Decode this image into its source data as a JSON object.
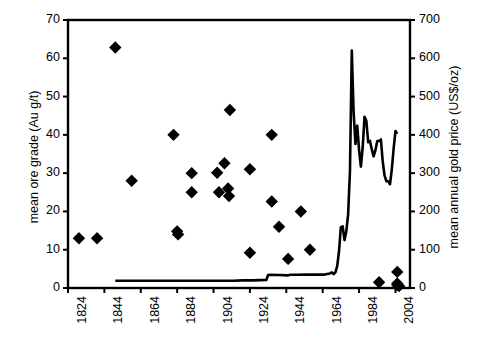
{
  "chart_data": {
    "type": "scatter",
    "title": "",
    "xlabel": "",
    "ylabel": "mean ore grade (Au g/t)",
    "y2label": "mean annual gold price (US$/oz)",
    "xlim": [
      1824,
      2012
    ],
    "ylim": [
      0,
      70
    ],
    "y2lim": [
      0,
      700
    ],
    "grid": false,
    "legend": "none",
    "x_ticks": [
      "1824",
      "1844",
      "1864",
      "1884",
      "1904",
      "1924",
      "1944",
      "1964",
      "1984",
      "2004"
    ],
    "x_tick_values": [
      1824,
      1844,
      1864,
      1884,
      1904,
      1924,
      1944,
      1964,
      1984,
      2004
    ],
    "y_ticks": [
      "0",
      "10",
      "20",
      "30",
      "40",
      "50",
      "60",
      "70"
    ],
    "y_tick_values": [
      0,
      10,
      20,
      30,
      40,
      50,
      60,
      70
    ],
    "y2_ticks": [
      "0",
      "100",
      "200",
      "300",
      "400",
      "500",
      "600",
      "700"
    ],
    "y2_tick_values": [
      0,
      100,
      200,
      300,
      400,
      500,
      600,
      700
    ],
    "series": [
      {
        "name": "mean ore grade",
        "type": "scatter",
        "marker": "diamond",
        "color": "#000000",
        "axis": "left",
        "points": [
          [
            1830,
            13.0
          ],
          [
            1840,
            13.0
          ],
          [
            1850,
            62.8
          ],
          [
            1859,
            28.0
          ],
          [
            1882,
            40.0
          ],
          [
            1884,
            14.8
          ],
          [
            1884.5,
            14.0
          ],
          [
            1892,
            30.0
          ],
          [
            1892,
            25.0
          ],
          [
            1906,
            30.1
          ],
          [
            1907,
            25.0
          ],
          [
            1910,
            32.6
          ],
          [
            1913,
            46.5
          ],
          [
            1912,
            26.0
          ],
          [
            1912.5,
            24.0
          ],
          [
            1924,
            31.0
          ],
          [
            1924,
            9.2
          ],
          [
            1936,
            40.0
          ],
          [
            1936,
            22.6
          ],
          [
            1940,
            16.0
          ],
          [
            1945,
            7.6
          ],
          [
            1952,
            20.0
          ],
          [
            1957,
            10.0
          ],
          [
            1995,
            1.5
          ],
          [
            2005,
            4.2
          ],
          [
            2005,
            1.2
          ],
          [
            2005,
            0.8
          ],
          [
            2006,
            0.5
          ]
        ]
      },
      {
        "name": "mean annual gold price",
        "type": "line",
        "color": "#000000",
        "axis": "right",
        "points": [
          [
            1850,
            19
          ],
          [
            1860,
            19
          ],
          [
            1880,
            19
          ],
          [
            1900,
            19
          ],
          [
            1915,
            19
          ],
          [
            1920,
            20
          ],
          [
            1925,
            20
          ],
          [
            1930,
            20.6
          ],
          [
            1933,
            21
          ],
          [
            1934,
            34
          ],
          [
            1935,
            34.5
          ],
          [
            1940,
            34
          ],
          [
            1945,
            33
          ],
          [
            1946,
            34.7
          ],
          [
            1950,
            34.7
          ],
          [
            1955,
            35
          ],
          [
            1960,
            35
          ],
          [
            1965,
            35
          ],
          [
            1968,
            38
          ],
          [
            1969,
            41
          ],
          [
            1970,
            36
          ],
          [
            1971,
            41
          ],
          [
            1972,
            58
          ],
          [
            1973,
            97
          ],
          [
            1974,
            159
          ],
          [
            1975,
            161
          ],
          [
            1976,
            125
          ],
          [
            1977,
            148
          ],
          [
            1978,
            193
          ],
          [
            1979,
            306
          ],
          [
            1980,
            620
          ],
          [
            1981,
            460
          ],
          [
            1982,
            376
          ],
          [
            1983,
            424
          ],
          [
            1984,
            361
          ],
          [
            1985,
            317
          ],
          [
            1986,
            368
          ],
          [
            1987,
            447
          ],
          [
            1988,
            437
          ],
          [
            1989,
            381
          ],
          [
            1990,
            384
          ],
          [
            1991,
            362
          ],
          [
            1992,
            344
          ],
          [
            1993,
            360
          ],
          [
            1994,
            384
          ],
          [
            1995,
            384
          ],
          [
            1996,
            388
          ],
          [
            1997,
            331
          ],
          [
            1998,
            294
          ],
          [
            1999,
            279
          ],
          [
            2000,
            279
          ],
          [
            2001,
            271
          ],
          [
            2002,
            310
          ],
          [
            2003,
            364
          ],
          [
            2004,
            410
          ],
          [
            2005,
            403
          ]
        ]
      }
    ]
  },
  "axes": {
    "left_title": "mean ore grade (Au g/t)",
    "right_title": "mean annual gold price (US$/oz)"
  }
}
